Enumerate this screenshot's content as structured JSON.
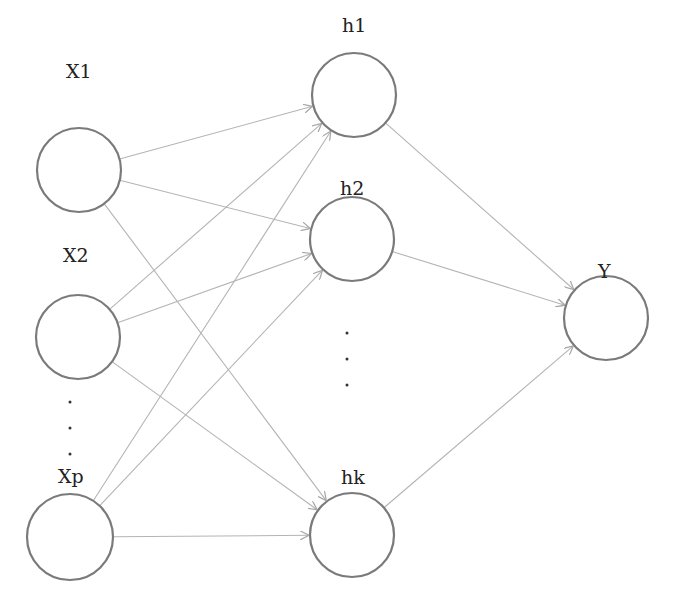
{
  "diagram": {
    "title": "",
    "type": "neural-network",
    "colors": {
      "node_stroke": "#7a7a7a",
      "edge": "#b4b4b4",
      "text": "#222222"
    },
    "layers": {
      "input": [
        {
          "id": "x1",
          "label": "X1",
          "cx": 79,
          "cy": 170,
          "r": 42,
          "lx": 66,
          "ly": 78
        },
        {
          "id": "x2",
          "label": "X2",
          "cx": 78,
          "cy": 337,
          "r": 42,
          "lx": 63,
          "ly": 262
        },
        {
          "id": "xp",
          "label": "Xp",
          "cx": 70,
          "cy": 537,
          "r": 43,
          "lx": 58,
          "ly": 483
        }
      ],
      "hidden": [
        {
          "id": "h1",
          "label": "h1",
          "cx": 354,
          "cy": 95,
          "r": 42,
          "lx": 342,
          "ly": 32
        },
        {
          "id": "h2",
          "label": "h2",
          "cx": 352,
          "cy": 239,
          "r": 42,
          "lx": 340,
          "ly": 195
        },
        {
          "id": "hk",
          "label": "hk",
          "cx": 352,
          "cy": 535,
          "r": 42,
          "lx": 341,
          "ly": 484
        }
      ],
      "output": [
        {
          "id": "y",
          "label": "Y",
          "cx": 606,
          "cy": 318,
          "r": 42,
          "lx": 598,
          "ly": 278
        }
      ]
    },
    "ellipsis": {
      "input": {
        "x": 70,
        "ys": [
          402,
          428,
          454
        ]
      },
      "hidden": {
        "x": 347,
        "ys": [
          333,
          359,
          385
        ]
      }
    },
    "edges": [
      [
        "x1",
        "h1"
      ],
      [
        "x1",
        "h2"
      ],
      [
        "x1",
        "hk"
      ],
      [
        "x2",
        "h1"
      ],
      [
        "x2",
        "h2"
      ],
      [
        "x2",
        "hk"
      ],
      [
        "xp",
        "h1"
      ],
      [
        "xp",
        "h2"
      ],
      [
        "xp",
        "hk"
      ],
      [
        "h1",
        "y"
      ],
      [
        "h2",
        "y"
      ],
      [
        "hk",
        "y"
      ]
    ]
  }
}
